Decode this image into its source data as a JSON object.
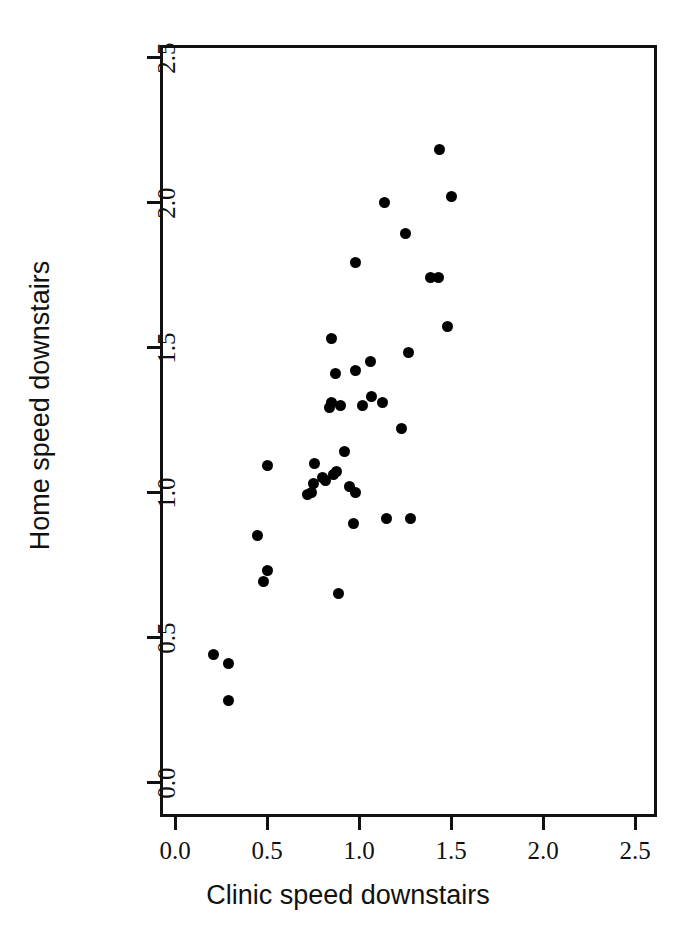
{
  "chart_data": {
    "type": "scatter",
    "title": "",
    "xlabel": "Clinic speed downstairs",
    "ylabel": "Home speed downstairs",
    "xlim": [
      -0.08,
      2.7
    ],
    "ylim": [
      -0.12,
      2.66
    ],
    "xticks": [
      0.0,
      0.5,
      1.0,
      1.5,
      2.0,
      2.5
    ],
    "yticks": [
      0.0,
      0.5,
      1.0,
      1.5,
      2.0,
      2.5
    ],
    "xticklabels": [
      "0.0",
      "0.5",
      "1.0",
      "1.5",
      "2.0",
      "2.5"
    ],
    "yticklabels": [
      "0.0",
      "0.5",
      "1.0",
      "1.5",
      "2.0",
      "2.5"
    ],
    "grid": false,
    "legend": false,
    "marker": "filled-circle",
    "marker_color": "#000000",
    "n_points": 45,
    "points": [
      [
        0.21,
        0.44
      ],
      [
        0.29,
        0.41
      ],
      [
        0.29,
        0.28
      ],
      [
        0.45,
        0.85
      ],
      [
        0.48,
        0.69
      ],
      [
        0.5,
        0.73
      ],
      [
        0.5,
        1.09
      ],
      [
        0.72,
        0.99
      ],
      [
        0.74,
        1.0
      ],
      [
        0.75,
        1.03
      ],
      [
        0.76,
        1.1
      ],
      [
        0.8,
        1.05
      ],
      [
        0.82,
        1.04
      ],
      [
        0.84,
        1.29
      ],
      [
        0.85,
        1.31
      ],
      [
        0.85,
        1.53
      ],
      [
        0.86,
        1.06
      ],
      [
        0.87,
        1.41
      ],
      [
        0.88,
        1.07
      ],
      [
        0.89,
        0.65
      ],
      [
        0.9,
        1.3
      ],
      [
        0.92,
        1.14
      ],
      [
        0.95,
        1.02
      ],
      [
        0.97,
        0.89
      ],
      [
        0.98,
        1.0
      ],
      [
        0.98,
        1.42
      ],
      [
        0.98,
        1.79
      ],
      [
        1.02,
        1.3
      ],
      [
        1.06,
        1.45
      ],
      [
        1.07,
        1.33
      ],
      [
        1.13,
        1.31
      ],
      [
        1.14,
        2.0
      ],
      [
        1.15,
        0.91
      ],
      [
        1.23,
        1.22
      ],
      [
        1.25,
        1.89
      ],
      [
        1.27,
        1.48
      ],
      [
        1.28,
        0.91
      ],
      [
        1.39,
        1.74
      ],
      [
        1.43,
        1.74
      ],
      [
        1.44,
        2.18
      ],
      [
        1.48,
        1.57
      ],
      [
        1.5,
        2.02
      ]
    ]
  }
}
